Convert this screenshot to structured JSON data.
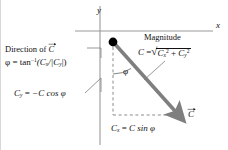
{
  "figure": {
    "axes": {
      "x_label": "x",
      "y_label": "y",
      "x_axis": {
        "y": 31,
        "x_start": 74,
        "x_end": 212
      },
      "y_axis": {
        "x": 99,
        "y_start": 6,
        "y_end": 145
      }
    },
    "annotations": {
      "direction_label": "Direction of",
      "direction_symbol": "C",
      "phi_definition": {
        "lhs": "φ",
        "eq": "=",
        "fn": "tan",
        "exp": "−1",
        "arg": "(C",
        "arg_sub1": "x",
        "arg_mid": "/|C",
        "arg_sub2": "y",
        "arg_end": "|)"
      },
      "magnitude_label": "Magnitude",
      "magnitude_formula": {
        "lhs": "C",
        "eq": "=",
        "term1": "C",
        "term1_sub": "x",
        "term1_sup": "2",
        "plus": "+",
        "term2": "C",
        "term2_sub": "y",
        "term2_sup": "2"
      },
      "cy_component": {
        "lhs": "C",
        "lhs_sub": "y",
        "eq": "=",
        "rhs": "−C cos φ"
      },
      "cx_component": {
        "lhs": "C",
        "lhs_sub": "x",
        "eq": "=",
        "rhs": "C sin φ"
      },
      "angle_symbol": "φ",
      "vector_symbol": "C"
    },
    "colors": {
      "vector_gray": "#808080",
      "axis_gray": "#9a9a9a",
      "dashed_gray": "#8c8c8c",
      "leader_gray": "#7d7d7d",
      "text_black": "#111111",
      "dot_black": "#000000"
    },
    "geometry": {
      "origin_dot": {
        "x": 112,
        "y": 42,
        "r": 4.2
      },
      "vector_tip": {
        "x": 178,
        "y": 115
      },
      "dashed_vertical": {
        "x": 112,
        "y_start": 47,
        "y_end": 115
      },
      "dashed_horizontal": {
        "y": 115,
        "x_start": 112,
        "x_end": 176
      },
      "angle_arc_radius": 26
    }
  }
}
